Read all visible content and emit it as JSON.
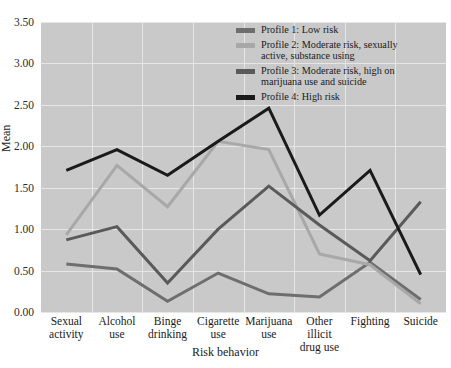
{
  "chart_data": {
    "type": "line",
    "title": "",
    "xlabel": "Risk behavior",
    "ylabel": "Mean",
    "ylim": [
      0.0,
      3.5
    ],
    "ytick_labels": [
      "0.00",
      "0.50",
      "1.00",
      "1.50",
      "2.00",
      "2.50",
      "3.00",
      "3.50"
    ],
    "ytick_values": [
      0.0,
      0.5,
      1.0,
      1.5,
      2.0,
      2.5,
      3.0,
      3.5
    ],
    "grid": true,
    "legend_position": "top-right",
    "categories": [
      "Sexual activity",
      "Alcohol use",
      "Binge drinking",
      "Cigarette use",
      "Marijuana use",
      "Other illicit drug use",
      "Fighting",
      "Suicide"
    ],
    "categories_lines": [
      [
        "Sexual",
        "activity"
      ],
      [
        "Alcohol",
        "use"
      ],
      [
        "Binge",
        "drinking"
      ],
      [
        "Cigarette",
        "use"
      ],
      [
        "Marijuana",
        "use"
      ],
      [
        "Other",
        "illicit",
        "drug use"
      ],
      [
        "Fighting"
      ],
      [
        "Suicide"
      ]
    ],
    "series": [
      {
        "name": "Profile 1: Low risk",
        "label_lines": [
          "Profile 1: Low risk"
        ],
        "color": "#6e6e6e",
        "values": [
          0.58,
          0.52,
          0.13,
          0.47,
          0.22,
          0.18,
          0.6,
          0.15
        ]
      },
      {
        "name": "Profile 2: Moderate risk, sexually active, substance using",
        "label_lines": [
          "Profile 2: Moderate risk, sexually",
          "active, substance using"
        ],
        "color": "#a8a8a8",
        "values": [
          0.93,
          1.77,
          1.27,
          2.06,
          1.96,
          0.7,
          0.57,
          0.1
        ]
      },
      {
        "name": "Profile 3: Moderate risk, high on marijuana use and suicide",
        "label_lines": [
          "Profile 3: Moderate risk, high on",
          "marijuana use and suicide"
        ],
        "color": "#5a5a5a",
        "values": [
          0.87,
          1.03,
          0.35,
          1.0,
          1.52,
          1.05,
          0.62,
          1.33
        ]
      },
      {
        "name": "Profile 4: High risk",
        "label_lines": [
          "Profile 4: High risk"
        ],
        "color": "#1a1a1a",
        "values": [
          1.71,
          1.96,
          1.65,
          2.06,
          2.46,
          1.17,
          1.71,
          0.45
        ]
      }
    ]
  },
  "legend": {
    "items": [
      {
        "label": "Profile 1: Low risk",
        "color": "#6e6e6e"
      },
      {
        "label": "Profile 2: Moderate risk, sexually active, substance using",
        "color": "#a8a8a8"
      },
      {
        "label": "Profile 3: Moderate risk, high on marijuana use and suicide",
        "color": "#5a5a5a"
      },
      {
        "label": "Profile 4: High risk",
        "color": "#1a1a1a"
      }
    ]
  }
}
